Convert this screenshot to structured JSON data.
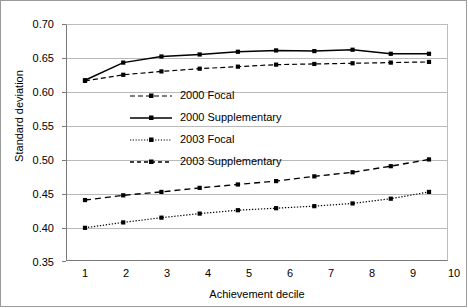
{
  "chart_data": {
    "type": "line",
    "title": "",
    "xlabel": "Achievement decile",
    "ylabel": "Standard deviation",
    "categories": [
      "1",
      "2",
      "3",
      "4",
      "5",
      "6",
      "7",
      "8",
      "9",
      "10"
    ],
    "x": [
      1,
      2,
      3,
      4,
      5,
      6,
      7,
      8,
      9,
      10
    ],
    "xlim": [
      0.5,
      10.5
    ],
    "ylim": [
      0.35,
      0.7
    ],
    "yticks": [
      "0.35",
      "0.40",
      "0.45",
      "0.50",
      "0.55",
      "0.60",
      "0.65",
      "0.70"
    ],
    "ytick_values": [
      0.35,
      0.4,
      0.45,
      0.5,
      0.55,
      0.6,
      0.65,
      0.7
    ],
    "grid": "horizontal",
    "legend_position": "center-left",
    "series": [
      {
        "name": "2000 Focal",
        "style": "dashed",
        "marker": "square",
        "values": [
          0.616,
          0.625,
          0.63,
          0.634,
          0.637,
          0.64,
          0.641,
          0.642,
          0.643,
          0.644
        ]
      },
      {
        "name": "2000 Supplementary",
        "style": "solid",
        "marker": "square",
        "values": [
          0.617,
          0.643,
          0.652,
          0.655,
          0.659,
          0.661,
          0.66,
          0.662,
          0.656,
          0.656
        ]
      },
      {
        "name": "2003 Focal",
        "style": "dashed-long",
        "marker": "square",
        "values": [
          0.44,
          0.447,
          0.452,
          0.458,
          0.463,
          0.468,
          0.475,
          0.481,
          0.49,
          0.5
        ]
      },
      {
        "name": "2003 Supplementary",
        "style": "dotted",
        "marker": "square",
        "values": [
          0.399,
          0.407,
          0.414,
          0.42,
          0.425,
          0.428,
          0.431,
          0.435,
          0.442,
          0.452
        ]
      }
    ]
  },
  "legend": {
    "items": [
      {
        "label": "2000 Focal"
      },
      {
        "label": "2000 Supplementary"
      },
      {
        "label": "2003 Focal"
      },
      {
        "label": "2003 Supplementary"
      }
    ]
  },
  "colors": {
    "series": "#000000",
    "grid": "#b9b9b9",
    "axis": "#7a7a7a",
    "background": "#ffffff"
  }
}
